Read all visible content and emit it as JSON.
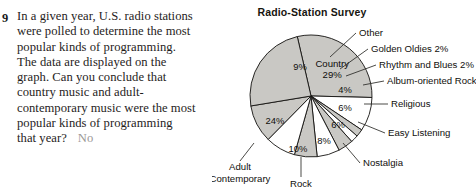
{
  "problem": {
    "number": "9",
    "lines": [
      "In a given year, U.S. radio stations",
      "were polled to determine the most",
      "popular kinds of programming.",
      "The data are displayed on the",
      "graph. Can you conclude that",
      "country music and adult-",
      "contemporary music were the most",
      "popular kinds of programming",
      "that year?"
    ],
    "answer": "No"
  },
  "chart_data": {
    "type": "pie",
    "title": "Radio-Station Survey",
    "xlabel": "",
    "ylabel": "",
    "legend_position": "callout-labels",
    "grid": false,
    "categories": [
      "Country",
      "Other",
      "Golden Oldies",
      "Rhythm and Blues",
      "Album-oriented Rock",
      "Religious",
      "Easy Listening",
      "Nostalgia",
      "Rock",
      "Adult Contemporary"
    ],
    "values": [
      29,
      9,
      2,
      2,
      4,
      6,
      6,
      8,
      10,
      24
    ],
    "unit": "%",
    "slices": [
      {
        "name": "Country",
        "value": 29,
        "value_label": "29%",
        "name_label": "Country",
        "label_placement": "inside",
        "fill": "#c9c8c4"
      },
      {
        "name": "Other",
        "value": 9,
        "value_label": "9%",
        "name_label": "Other",
        "label_placement": "callout",
        "fill": "#ffffff"
      },
      {
        "name": "Golden Oldies",
        "value": 2,
        "value_label": "",
        "name_label": "Golden Oldies 2%",
        "label_placement": "callout",
        "fill": "#c9c8c4"
      },
      {
        "name": "Rhythm and Blues",
        "value": 2,
        "value_label": "",
        "name_label": "Rhythm and Blues 2%",
        "label_placement": "callout",
        "fill": "#ffffff"
      },
      {
        "name": "Album-oriented Rock",
        "value": 4,
        "value_label": "4%",
        "name_label": "Album-oriented Rock",
        "label_placement": "callout",
        "fill": "#c9c8c4"
      },
      {
        "name": "Religious",
        "value": 6,
        "value_label": "6%",
        "name_label": "Religious",
        "label_placement": "callout",
        "fill": "#ffffff"
      },
      {
        "name": "Easy Listening",
        "value": 6,
        "value_label": "6%",
        "name_label": "Easy Listening",
        "label_placement": "callout",
        "fill": "#c9c8c4"
      },
      {
        "name": "Nostalgia",
        "value": 8,
        "value_label": "8%",
        "name_label": "Nostalgia",
        "label_placement": "callout",
        "fill": "#ffffff"
      },
      {
        "name": "Rock",
        "value": 10,
        "value_label": "10%",
        "name_label": "Rock",
        "label_placement": "callout",
        "fill": "#c9c8c4"
      },
      {
        "name": "Adult Contemporary",
        "value": 24,
        "value_label": "24%",
        "name_label": "Adult Contemporary",
        "label_placement": "callout",
        "fill": "#c9c8c4"
      }
    ]
  },
  "colors": {
    "pie_fill_gray": "#c9c8c4",
    "pie_fill_white": "#ffffff",
    "pie_stroke": "#131210",
    "text": "#100f0c",
    "answer_gray": "#9b9896",
    "page_background": "#ffffff"
  },
  "callouts": {
    "adult_contemporary_line1": "Adult",
    "adult_contemporary_line2": "Contemporary"
  }
}
